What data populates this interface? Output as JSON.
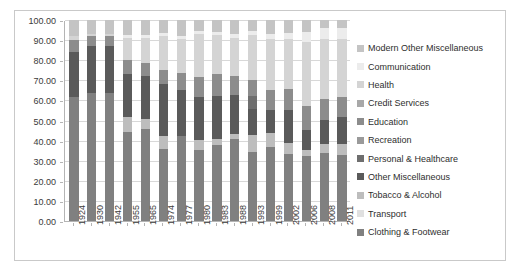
{
  "chart_data": {
    "type": "bar",
    "subtype": "100% stacked column",
    "title": "",
    "xlabel": "",
    "ylabel": "",
    "ylim": [
      0,
      100
    ],
    "yticks": [
      "0.00",
      "10.00",
      "20.00",
      "30.00",
      "40.00",
      "50.00",
      "60.00",
      "70.00",
      "80.00",
      "90.00",
      "100.00"
    ],
    "grid": true,
    "legend_position": "right",
    "categories": [
      "1924",
      "1930",
      "1942",
      "1955",
      "1965",
      "1974",
      "1977",
      "1980",
      "1983",
      "1988",
      "1993",
      "1999",
      "2002",
      "2006",
      "2008",
      "2011"
    ],
    "series": [
      {
        "name": "Clothing & Footwear",
        "color": "#808080",
        "values": [
          61.8,
          63.5,
          63.5,
          44.5,
          46.0,
          36.0,
          42.5,
          35.5,
          38.0,
          41.0,
          34.5,
          37.0,
          33.5,
          32.5,
          34.0,
          33.0
        ]
      },
      {
        "name": "Transport",
        "color": "#e0e0e0",
        "values": [
          0.0,
          0.0,
          0.0,
          0.0,
          0.0,
          0.0,
          0.0,
          0.0,
          0.0,
          0.0,
          0.0,
          0.0,
          0.0,
          0.0,
          0.0,
          0.0
        ]
      },
      {
        "name": "Tobacco & Alcohol",
        "color": "#bdbdbd",
        "values": [
          0.0,
          0.0,
          0.0,
          7.5,
          5.0,
          6.5,
          0.0,
          5.0,
          3.0,
          2.5,
          8.5,
          7.0,
          5.5,
          3.0,
          4.5,
          5.5
        ]
      },
      {
        "name": "Other Miscellaneous",
        "color": "#5a5a5a",
        "values": [
          22.2,
          23.5,
          23.5,
          21.0,
          21.0,
          25.5,
          22.5,
          21.0,
          21.0,
          19.0,
          12.5,
          11.0,
          16.0,
          10.0,
          12.0,
          13.5
        ]
      },
      {
        "name": "Personal & Healthcare",
        "color": "#6e6e6e",
        "values": [
          0.0,
          0.0,
          0.0,
          0.0,
          0.0,
          0.0,
          0.0,
          0.0,
          0.0,
          0.0,
          6.5,
          0.0,
          0.0,
          0.0,
          0.0,
          0.0
        ]
      },
      {
        "name": "Recreation",
        "color": "#9a9a9a",
        "values": [
          0.0,
          0.0,
          0.0,
          0.0,
          0.0,
          0.0,
          0.0,
          0.0,
          0.0,
          0.0,
          0.0,
          0.0,
          0.0,
          0.0,
          0.0,
          0.0
        ]
      },
      {
        "name": "Education",
        "color": "#8c8c8c",
        "values": [
          6.0,
          5.0,
          5.0,
          7.0,
          6.5,
          7.0,
          8.5,
          10.0,
          11.0,
          9.5,
          8.0,
          10.0,
          10.5,
          11.5,
          10.0,
          9.5
        ]
      },
      {
        "name": "Credit Services",
        "color": "#a8a8a8",
        "values": [
          0.0,
          0.0,
          0.0,
          0.0,
          0.0,
          0.0,
          0.0,
          0.0,
          0.0,
          0.0,
          0.0,
          0.0,
          0.0,
          0.0,
          0.0,
          0.0
        ]
      },
      {
        "name": "Health",
        "color": "#d4d4d4",
        "values": [
          2.0,
          1.0,
          1.0,
          11.0,
          12.5,
          17.0,
          17.0,
          21.5,
          19.5,
          19.0,
          22.5,
          25.5,
          25.0,
          32.0,
          30.0,
          29.0
        ]
      },
      {
        "name": "Communication",
        "color": "#ececec",
        "values": [
          0.0,
          0.0,
          0.0,
          1.5,
          1.5,
          1.5,
          1.5,
          1.5,
          1.5,
          2.0,
          2.0,
          2.5,
          3.0,
          5.0,
          5.5,
          5.5
        ]
      },
      {
        "name": "Modern Other Miscellaneous",
        "color": "#c4c4c4",
        "values": [
          8.0,
          7.0,
          7.0,
          7.5,
          7.5,
          6.5,
          8.0,
          5.5,
          6.0,
          7.0,
          5.5,
          7.0,
          6.5,
          6.0,
          4.0,
          4.0
        ]
      }
    ],
    "legend_entries": [
      {
        "label": "Modern Other Miscellaneous",
        "color": "#c4c4c4"
      },
      {
        "label": "Communication",
        "color": "#ececec"
      },
      {
        "label": "Health",
        "color": "#d4d4d4"
      },
      {
        "label": "Credit Services",
        "color": "#a8a8a8"
      },
      {
        "label": "Education",
        "color": "#8c8c8c"
      },
      {
        "label": "Recreation",
        "color": "#9a9a9a"
      },
      {
        "label": "Personal & Healthcare",
        "color": "#6e6e6e"
      },
      {
        "label": "Other Miscellaneous",
        "color": "#5a5a5a"
      },
      {
        "label": "Tobacco & Alcohol",
        "color": "#bdbdbd"
      },
      {
        "label": "Transport",
        "color": "#e0e0e0"
      },
      {
        "label": "Clothing & Footwear",
        "color": "#808080"
      }
    ]
  }
}
